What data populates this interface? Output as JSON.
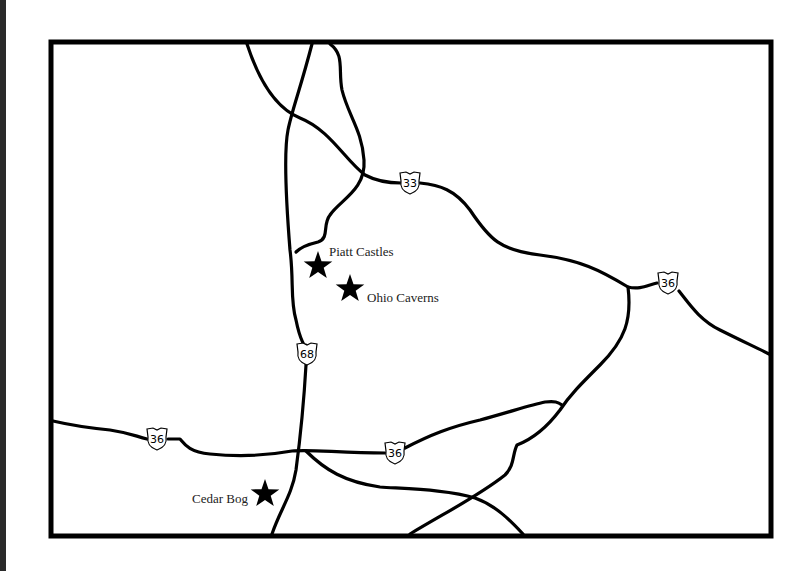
{
  "map": {
    "background": "#ffffff",
    "frame_color": "#000000",
    "road_color": "#000000",
    "shields": [
      {
        "route": "33",
        "x": 410,
        "y": 183
      },
      {
        "route": "36",
        "x": 668,
        "y": 283
      },
      {
        "route": "68",
        "x": 307,
        "y": 354
      },
      {
        "route": "36",
        "x": 157,
        "y": 439
      },
      {
        "route": "36",
        "x": 395,
        "y": 453
      }
    ],
    "points_of_interest": [
      {
        "name": "Piatt Castles",
        "star_x": 318,
        "star_y": 266,
        "label_x": 329,
        "label_y": 255
      },
      {
        "name": "Ohio Caverns",
        "star_x": 350,
        "star_y": 289,
        "label_x": 367,
        "label_y": 302
      },
      {
        "name": "Cedar Bog",
        "star_x": 265,
        "star_y": 494,
        "label_x": 192,
        "label_y": 503
      }
    ]
  }
}
